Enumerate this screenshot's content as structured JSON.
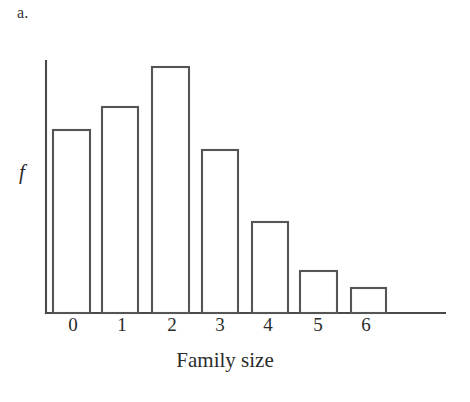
{
  "figure": {
    "part_label": "a.",
    "background_color": "#ffffff",
    "line_color": "#4a4a4a",
    "bar_fill_color": "#ffffff",
    "bar_stroke_color": "#555555"
  },
  "chart_data": {
    "type": "bar",
    "title": "",
    "subtitle": "",
    "xlabel": "Family size",
    "ylabel": "f",
    "categories": [
      "0",
      "1",
      "2",
      "3",
      "4",
      "5",
      "6"
    ],
    "values": [
      183,
      206,
      246,
      163,
      91,
      42,
      25
    ],
    "value_units": "relative frequency (unlabeled axis, pixel heights)",
    "xlim": [
      -0.5,
      7.5
    ],
    "ylim": [
      0,
      252
    ],
    "grid": false,
    "legend": null,
    "axis_ticks_y": [],
    "annotations": []
  },
  "geometry": {
    "axis_origin_x": 46,
    "axis_baseline_y": 313,
    "axis_top_y": 61,
    "axis_right_x": 445,
    "bars": [
      {
        "label": "0",
        "left": 53,
        "right": 90,
        "top": 130
      },
      {
        "label": "1",
        "left": 102,
        "right": 138,
        "top": 107
      },
      {
        "label": "2",
        "left": 152,
        "right": 189,
        "top": 67
      },
      {
        "label": "3",
        "left": 202,
        "right": 238,
        "top": 150
      },
      {
        "label": "4",
        "left": 252,
        "right": 288,
        "top": 222
      },
      {
        "label": "5",
        "left": 300,
        "right": 337,
        "top": 271
      },
      {
        "label": "6",
        "left": 351,
        "right": 386,
        "top": 288
      }
    ],
    "tick_label_positions_x": [
      73,
      122,
      172,
      220,
      268,
      318,
      366
    ],
    "tick_label_top_y": 314
  }
}
